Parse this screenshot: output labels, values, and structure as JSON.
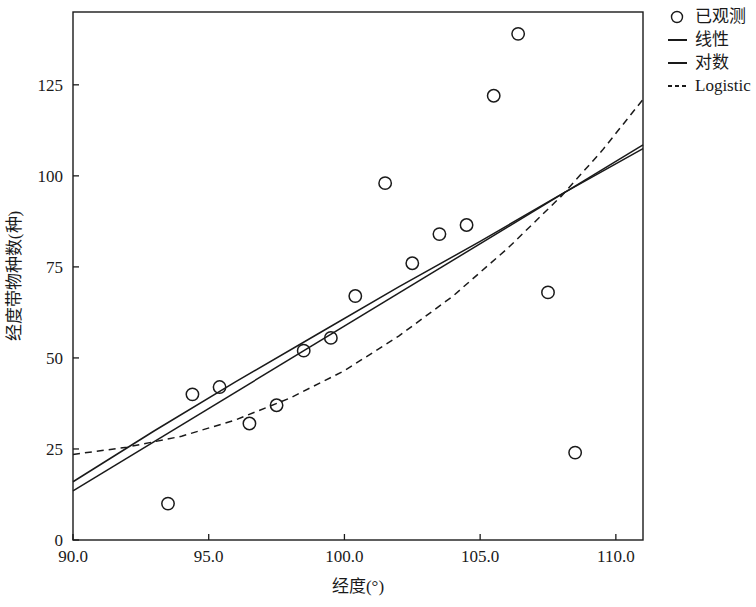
{
  "chart_data": {
    "type": "scatter",
    "title": "",
    "xlabel": "经度(°)",
    "ylabel": "经度带物种数(种)",
    "xlim": [
      90.0,
      111.0
    ],
    "ylim": [
      0,
      145
    ],
    "grid": false,
    "xticks": [
      90.0,
      95.0,
      100.0,
      105.0,
      110.0
    ],
    "xtick_labels": [
      "90.0",
      "95.0",
      "100.0",
      "105.0",
      "110.0"
    ],
    "yticks": [
      0,
      25,
      50,
      75,
      100,
      125
    ],
    "ytick_labels": [
      "0",
      "25",
      "50",
      "75",
      "100",
      "125"
    ],
    "legend_position": "outside right top",
    "legend": [
      {
        "label": "已观测",
        "marker": "circle",
        "style": "marker"
      },
      {
        "label": "线性",
        "marker": "line",
        "style": "solid"
      },
      {
        "label": "对数",
        "marker": "line",
        "style": "solid"
      },
      {
        "label": "Logistic",
        "marker": "line",
        "style": "dashed"
      }
    ],
    "series": [
      {
        "name": "已观测",
        "type": "scatter",
        "marker": "open-circle",
        "x": [
          93.5,
          94.4,
          95.4,
          96.5,
          97.5,
          98.5,
          99.5,
          100.4,
          101.5,
          102.5,
          103.5,
          104.5,
          105.5,
          106.4,
          107.5,
          108.5
        ],
        "y": [
          10,
          40,
          42,
          32,
          37,
          52,
          55.5,
          67,
          98,
          76,
          84,
          86.5,
          122,
          139,
          68,
          24
        ]
      },
      {
        "name": "线性",
        "type": "line",
        "style": "solid",
        "x": [
          90.0,
          111.0
        ],
        "y": [
          13.5,
          108.5
        ]
      },
      {
        "name": "对数",
        "type": "line",
        "style": "solid",
        "x": [
          90.0,
          93.0,
          96.0,
          99.0,
          102.0,
          105.0,
          108.0,
          111.0
        ],
        "y": [
          16.0,
          30.0,
          43.5,
          56.5,
          69.5,
          82.0,
          95.0,
          107.5
        ]
      },
      {
        "name": "Logistic",
        "type": "line",
        "style": "dashed",
        "x": [
          90.0,
          92.0,
          94.0,
          96.0,
          98.0,
          100.0,
          102.0,
          104.0,
          106.0,
          108.0,
          109.5,
          111.0
        ],
        "y": [
          23.5,
          25.5,
          28.5,
          33.0,
          39.0,
          46.5,
          56.0,
          67.0,
          80.0,
          94.5,
          107.0,
          121.0
        ]
      }
    ]
  },
  "axes": {
    "x_label": "经度(°)",
    "y_label": "经度带物种数(种)"
  }
}
